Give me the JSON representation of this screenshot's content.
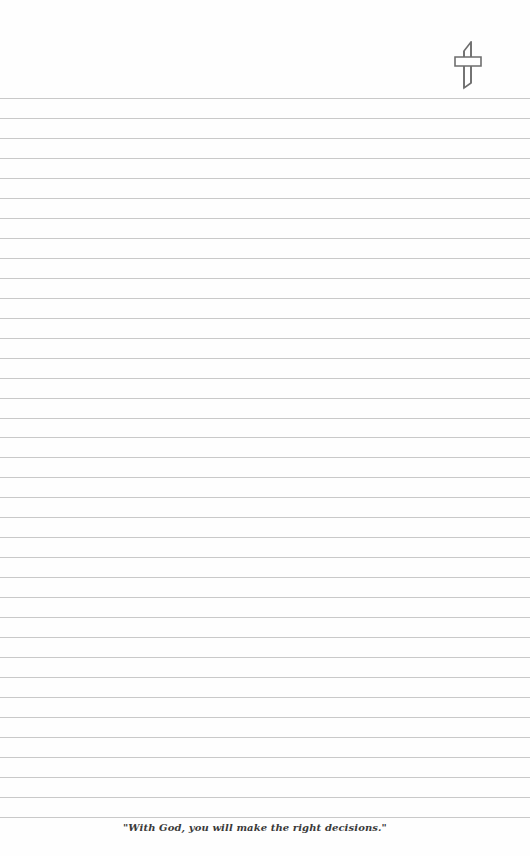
{
  "page": {
    "type": "lined notepad page",
    "background": "#fefefe",
    "rule_color": "#c9c9c9",
    "rules": {
      "count": 37,
      "first_y": 98,
      "spacing": 19.97
    }
  },
  "header": {
    "icon": "cross-icon",
    "icon_color": "#6e6e6e"
  },
  "footer": {
    "quote": "\"With God, you will make the right decisions.\""
  }
}
